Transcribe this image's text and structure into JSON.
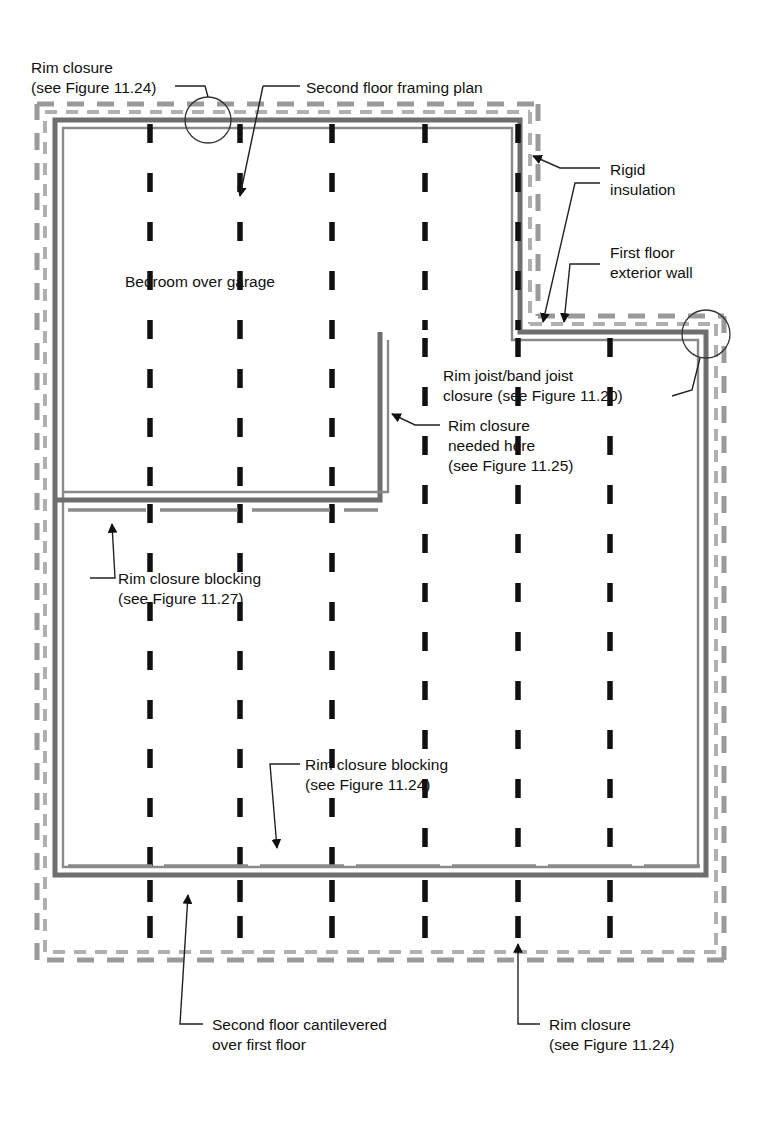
{
  "figure": {
    "type": "architectural-framing-plan"
  },
  "colors": {
    "wall_solid": "#6e6e6e",
    "wall_inner": "#8a8a8a",
    "joist_dash": "#111111",
    "insulation_dash": "#9a9a9a",
    "leader_line": "#222222",
    "text": "#111111",
    "background": "#ffffff"
  },
  "labels": {
    "rim_closure_top_left": {
      "line1": "Rim closure",
      "line2": "(see Figure 11.24)"
    },
    "second_floor_framing_plan": {
      "line1": "Second floor framing plan"
    },
    "rigid_insulation": {
      "line1": "Rigid",
      "line2": "insulation"
    },
    "first_floor_exterior_wall": {
      "line1": "First floor",
      "line2": "exterior wall"
    },
    "bedroom_over_garage": {
      "line1": "Bedroom over garage"
    },
    "rim_joist_band_joist": {
      "line1": "Rim joist/band joist",
      "line2": "closure (see Figure 11.20)"
    },
    "rim_closure_needed_here": {
      "line1": "Rim closure",
      "line2": "needed here",
      "line3": "(see Figure 11.25)"
    },
    "rim_closure_blocking_left": {
      "line1": "Rim closure blocking",
      "line2": "(see Figure 11.27)"
    },
    "rim_closure_blocking_mid": {
      "line1": "Rim closure blocking",
      "line2": "(see Figure 11.24)"
    },
    "second_floor_cantilevered": {
      "line1": "Second floor cantilevered",
      "line2": "over first floor"
    },
    "rim_closure_bottom_right": {
      "line1": "Rim closure",
      "line2": "(see Figure 11.24)"
    }
  },
  "callout_circles": [
    {
      "name": "rim-closure-top-left-circle",
      "cx": 208,
      "cy": 120,
      "r": 23
    },
    {
      "name": "rim-joist-band-joist-circle",
      "cx": 706,
      "cy": 334,
      "r": 24
    }
  ],
  "geometry": {
    "upper_block": {
      "left": 55,
      "top": 120,
      "right": 520,
      "bottom": 332
    },
    "lower_block": {
      "left": 55,
      "top": 332,
      "right": 706,
      "bottom": 875
    },
    "step_x": 380,
    "step_y": 332,
    "mid_wall_y": 500,
    "cantilever_bottom": 960,
    "joists_upper_x": [
      150,
      240,
      332,
      425
    ],
    "joists_lower_x": [
      150,
      240,
      332,
      425,
      518,
      610
    ],
    "insulation_offset": 18
  }
}
